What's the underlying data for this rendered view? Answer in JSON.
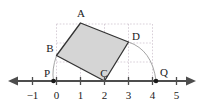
{
  "figure": {
    "type": "geometry-diagram",
    "axis": {
      "label_minus_one": "−1",
      "label_zero": "0",
      "label_one": "1",
      "label_two": "2",
      "label_three": "3",
      "label_four": "4",
      "label_five": "5",
      "ticks": [
        -1,
        0,
        1,
        2,
        3,
        4,
        5
      ],
      "tick_labels": [
        "−1",
        "0",
        "1",
        "2",
        "3",
        "4",
        "5"
      ],
      "arrow_left": true,
      "arrow_right": true,
      "color": "#4d4d4d"
    },
    "vertices": [
      {
        "name": "A",
        "label": "A",
        "x": 1.0,
        "y": 3.0
      },
      {
        "name": "B",
        "label": "B",
        "x": 0.0,
        "y": 1.35
      },
      {
        "name": "C",
        "label": "C",
        "x": 2.0,
        "y": 0.0
      },
      {
        "name": "D",
        "label": "D",
        "x": 3.0,
        "y": 1.65
      }
    ],
    "marked_points": [
      {
        "name": "P",
        "label": "P",
        "x": -0.1,
        "y": 0.0
      },
      {
        "name": "Q",
        "label": "Q",
        "x": 4.2,
        "y": 0.0
      }
    ],
    "arcs": [
      {
        "name": "arc-B-to-P",
        "from": "B",
        "to": "P"
      },
      {
        "name": "arc-D-to-Q",
        "from": "D",
        "to": "Q"
      }
    ],
    "square_fill": "#d4d4d4",
    "square_stroke": "#333333",
    "grid_color": "#c8b8c8",
    "grid_x_range": [
      0,
      4
    ],
    "grid_y_range": [
      0,
      3
    ],
    "arc_color": "#888888"
  }
}
